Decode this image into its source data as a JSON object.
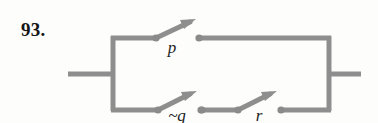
{
  "problem": {
    "number": "93."
  },
  "diagram": {
    "type": "switching-circuit",
    "colors": {
      "wire": "#8e8e8e",
      "wire_shadow": "#b4b4b4",
      "node": "#8a8a8a",
      "label": "#232323",
      "background": "#fdfdfb"
    },
    "branches": [
      {
        "name": "top-branch",
        "switches": [
          {
            "id": "p",
            "label": "p",
            "state": "open"
          }
        ]
      },
      {
        "name": "bottom-branch",
        "switches": [
          {
            "id": "not-q",
            "label": "~q",
            "state": "open"
          },
          {
            "id": "r",
            "label": "r",
            "state": "open"
          }
        ]
      }
    ],
    "terminals": {
      "left_lead": "input",
      "right_lead": "output"
    }
  }
}
